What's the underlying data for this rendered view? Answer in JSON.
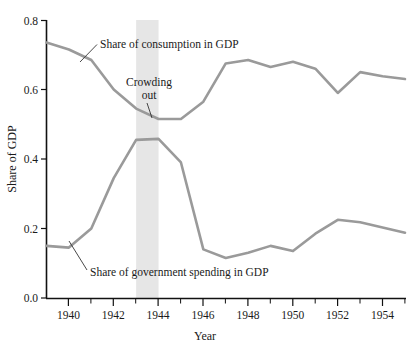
{
  "chart_data": {
    "type": "line",
    "title": "",
    "xlabel": "Year",
    "ylabel": "Share of GDP",
    "xlim": [
      1939,
      1955
    ],
    "ylim": [
      0.0,
      0.8
    ],
    "grid": false,
    "legend_position": "inline-annotations",
    "x": [
      1939,
      1940,
      1941,
      1942,
      1943,
      1944,
      1945,
      1946,
      1947,
      1948,
      1949,
      1950,
      1951,
      1952,
      1953,
      1954,
      1955
    ],
    "xticks_major": [
      "1940",
      "1942",
      "1944",
      "1946",
      "1948",
      "1950",
      "1952",
      "1954"
    ],
    "xticks_major_values": [
      1940,
      1942,
      1944,
      1946,
      1948,
      1950,
      1952,
      1954
    ],
    "xticks_minor_values": [
      1939,
      1941,
      1943,
      1945,
      1947,
      1949,
      1951,
      1953,
      1955
    ],
    "yticks": [
      "0.0",
      "0.2",
      "0.4",
      "0.6",
      "0.8"
    ],
    "yticks_values": [
      0.0,
      0.2,
      0.4,
      0.6,
      0.8
    ],
    "series": [
      {
        "name": "Share of consumption in GDP",
        "color": "#9a9a9a",
        "values": [
          0.735,
          0.715,
          0.685,
          0.6,
          0.545,
          0.515,
          0.515,
          0.565,
          0.675,
          0.685,
          0.665,
          0.68,
          0.66,
          0.59,
          0.65,
          0.638,
          0.63
        ]
      },
      {
        "name": "Share of government spending in GDP",
        "color": "#9a9a9a",
        "values": [
          0.15,
          0.145,
          0.2,
          0.345,
          0.455,
          0.458,
          0.39,
          0.14,
          0.115,
          0.13,
          0.15,
          0.135,
          0.185,
          0.225,
          0.218,
          0.203,
          0.188
        ]
      }
    ],
    "annotations": [
      {
        "name": "consumption-label",
        "text": "Share of consumption in GDP",
        "line1": "Share of consumption in GDP"
      },
      {
        "name": "crowding-out-label",
        "line1": "Crowding",
        "line2": "out"
      },
      {
        "name": "government-label",
        "text": "Share of government spending in GDP"
      }
    ],
    "highlight_band": {
      "label": "Crowding out",
      "from": 1943,
      "to": 1944,
      "color": "#e6e6e6"
    }
  },
  "axes": {
    "y_title": "Share of GDP",
    "x_title": "Year"
  },
  "labels": {
    "consumption": "Share of consumption in GDP",
    "crowding_line1": "Crowding",
    "crowding_line2": "out",
    "government": "Share of government spending in GDP"
  },
  "yticks": [
    "0.8",
    "0.6",
    "0.4",
    "0.2",
    "0.0"
  ],
  "xticks": [
    "1940",
    "1942",
    "1944",
    "1946",
    "1948",
    "1950",
    "1952",
    "1954"
  ],
  "colors": {
    "line": "#9a9a9a",
    "band": "#e6e6e6",
    "axis": "#111111",
    "text": "#1a1a1a"
  }
}
